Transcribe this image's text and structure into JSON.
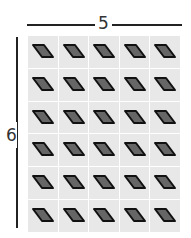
{
  "diagram": {
    "title": "",
    "width_label": "5",
    "height_label": "6",
    "grid": {
      "columns": 5,
      "rows": 6,
      "tile_count": 30
    },
    "tile": {
      "shape": "parallelogram",
      "tile_color": "#e8e8e8",
      "shape_fill": "#666666",
      "shape_stroke": "#111111"
    },
    "line_color": "#222222"
  }
}
